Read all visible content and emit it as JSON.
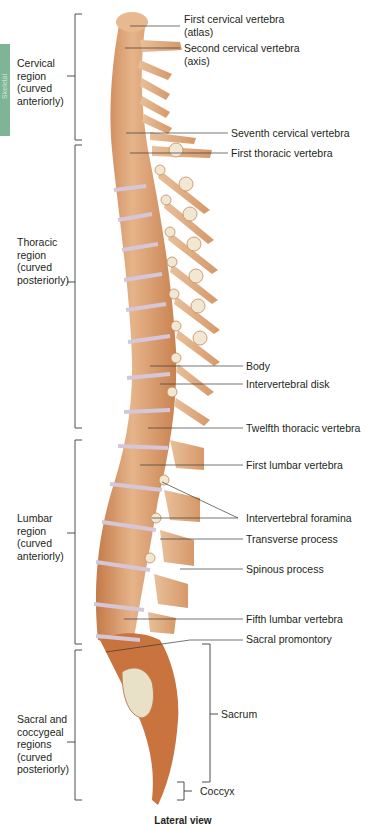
{
  "side_tab": {
    "label": "Skeletal",
    "color": "#7fb596"
  },
  "regions": [
    {
      "id": "cervical",
      "label": "Cervical region (curved anteriorly)",
      "lines": [
        "Cervical",
        "region",
        "(curved",
        "anteriorly)"
      ]
    },
    {
      "id": "thoracic",
      "label": "Thoracic region (curved posteriorly)",
      "lines": [
        "Thoracic",
        "region",
        "(curved",
        "posteriorly)"
      ]
    },
    {
      "id": "lumbar",
      "label": "Lumbar region (curved anteriorly)",
      "lines": [
        "Lumbar",
        "region",
        "(curved",
        "anteriorly)"
      ]
    },
    {
      "id": "sacral",
      "label": "Sacral and coccygeal regions (curved posteriorly)",
      "lines": [
        "Sacral and",
        "coccygeal",
        "regions",
        "(curved",
        "posteriorly)"
      ]
    }
  ],
  "labels": {
    "first_cervical": [
      "First cervical vertebra",
      "(atlas)"
    ],
    "second_cervical": [
      "Second cervical vertebra",
      "(axis)"
    ],
    "seventh_cervical": "Seventh cervical vertebra",
    "first_thoracic": "First thoracic vertebra",
    "body": "Body",
    "intervertebral_disk": "Intervertebral disk",
    "twelfth_thoracic": "Twelfth thoracic vertebra",
    "first_lumbar": "First lumbar vertebra",
    "intervertebral_foramina": "Intervertebral foramina",
    "transverse_process": "Transverse process",
    "spinous_process": "Spinous process",
    "fifth_lumbar": "Fifth lumbar vertebra",
    "sacral_promontory": "Sacral promontory",
    "sacrum": "Sacrum",
    "coccyx": "Coccyx"
  },
  "caption": "Lateral view",
  "colors": {
    "bone": "#d9a074",
    "bone_dark": "#b8693a",
    "bone_light": "#f0d2b0",
    "disk": "#ddd0dc",
    "line": "#3a3a3a"
  }
}
